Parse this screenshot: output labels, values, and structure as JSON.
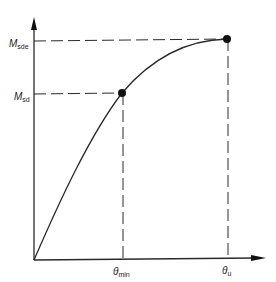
{
  "diagram": {
    "type": "moment-rotation curve",
    "colors": {
      "line": "#2a2a2a",
      "background": "#ffffff",
      "point": "#111111"
    },
    "y_axis": {
      "labels": [
        {
          "id": "m_sde",
          "main": "M",
          "sub": "sde"
        },
        {
          "id": "m_sd",
          "main": "M",
          "sub": "sd"
        }
      ]
    },
    "x_axis": {
      "labels": [
        {
          "id": "theta_min",
          "main": "θ",
          "sub": "min"
        },
        {
          "id": "theta_u",
          "main": "θ",
          "sub": "u"
        }
      ]
    },
    "points": [
      {
        "name": "design-point",
        "x_label": "θmin",
        "y_label": "Msd"
      },
      {
        "name": "ultimate-point",
        "x_label": "θu",
        "y_label": "Msde"
      }
    ]
  }
}
